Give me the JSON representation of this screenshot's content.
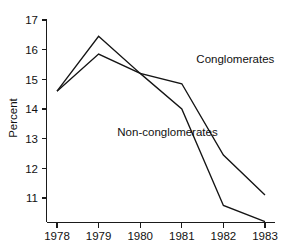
{
  "chart_data": {
    "type": "line",
    "title": "",
    "subtitle": "",
    "xlabel": "",
    "ylabel": "Percent",
    "categories": [
      "1978",
      "1979",
      "1980",
      "1981",
      "1982",
      "1983"
    ],
    "x": [
      1978,
      1979,
      1980,
      1981,
      1982,
      1983
    ],
    "series": [
      {
        "name": "Conglomerates",
        "values": [
          14.6,
          16.45,
          15.2,
          14.85,
          12.45,
          11.1
        ]
      },
      {
        "name": "Non-conglomerates",
        "values": [
          14.6,
          15.85,
          15.2,
          14.0,
          10.75,
          10.2
        ]
      }
    ],
    "xlim": [
      1978,
      1983
    ],
    "ylim": [
      10.15,
      17.1
    ],
    "yticks": [
      11,
      12,
      13,
      14,
      15,
      16,
      17
    ],
    "ytick_labels": [
      "11",
      "12",
      "13",
      "14",
      "15",
      "16",
      "17"
    ],
    "xticks": [
      1978,
      1979,
      1980,
      1981,
      1982,
      1983
    ],
    "xtick_labels": [
      "1978",
      "1979",
      "1980",
      "1981",
      "1982",
      "1983"
    ],
    "grid": false,
    "legend": "inline-annotations",
    "annotations": [
      {
        "text": "Conglomerates",
        "x": 1981.35,
        "y": 15.55
      },
      {
        "text": "Non-conglomerates",
        "x": 1979.45,
        "y": 13.1
      }
    ],
    "line_color": "#141414"
  },
  "axes": {
    "y_axis_title": "Percent"
  }
}
